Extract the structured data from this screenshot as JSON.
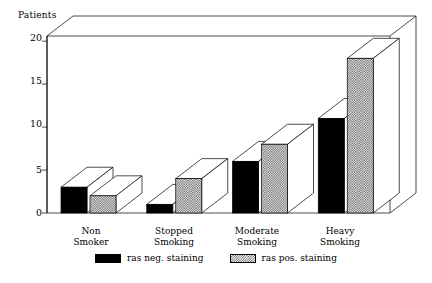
{
  "chart_data": {
    "type": "bar",
    "title": "",
    "xlabel": "",
    "ylabel": "Patients",
    "ylim": [
      0,
      20
    ],
    "yticks": [
      0,
      5,
      10,
      15,
      20
    ],
    "grid": false,
    "legend_position": "bottom-center",
    "style": "3d-grouped-bars",
    "categories": [
      "Non Smoker",
      "Stopped Smoking",
      "Moderate Smoking",
      "Heavy Smoking"
    ],
    "category_lines": [
      [
        "Non",
        "Smoker"
      ],
      [
        "Stopped",
        "Smoking"
      ],
      [
        "Moderate",
        "Smoking"
      ],
      [
        "Heavy",
        "Smoking"
      ]
    ],
    "series": [
      {
        "name": "ras neg. staining",
        "fill": "solid-black",
        "color": "#000000",
        "values": [
          3,
          1,
          6,
          11
        ]
      },
      {
        "name": "ras pos. staining",
        "fill": "checkered-hatch",
        "color": "#555555",
        "values": [
          2,
          4,
          8,
          18
        ]
      }
    ]
  },
  "axis": {
    "y_title": "Patients",
    "tick_labels": [
      "20",
      "15",
      "10",
      "5",
      "0"
    ]
  },
  "legend": {
    "items": [
      {
        "label": "ras neg. staining",
        "swatch": "solid"
      },
      {
        "label": "ras pos. staining",
        "swatch": "hatch"
      }
    ]
  }
}
